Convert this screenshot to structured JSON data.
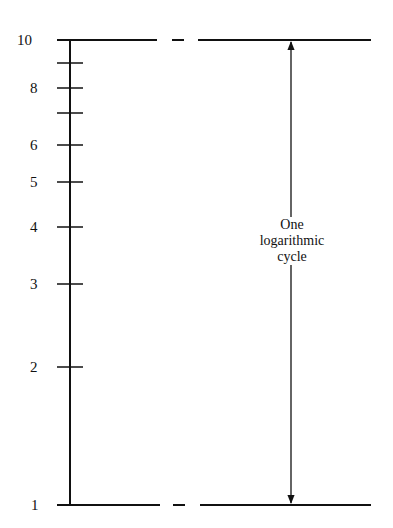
{
  "diagram": {
    "type": "logarithmic-scale-illustration",
    "axis": {
      "tick_labels": [
        {
          "value": "10",
          "y": 40
        },
        {
          "value": "",
          "y": 63
        },
        {
          "value": "8",
          "y": 88
        },
        {
          "value": "",
          "y": 113
        },
        {
          "value": "6",
          "y": 145
        },
        {
          "value": "5",
          "y": 182
        },
        {
          "value": "4",
          "y": 227
        },
        {
          "value": "3",
          "y": 284
        },
        {
          "value": "2",
          "y": 367
        },
        {
          "value": "1",
          "y": 505
        }
      ]
    },
    "annotation": {
      "line1": "One",
      "line2": "logarithmic",
      "line3": "cycle"
    },
    "colors": {
      "ink": "#111111",
      "background": "#ffffff"
    }
  }
}
